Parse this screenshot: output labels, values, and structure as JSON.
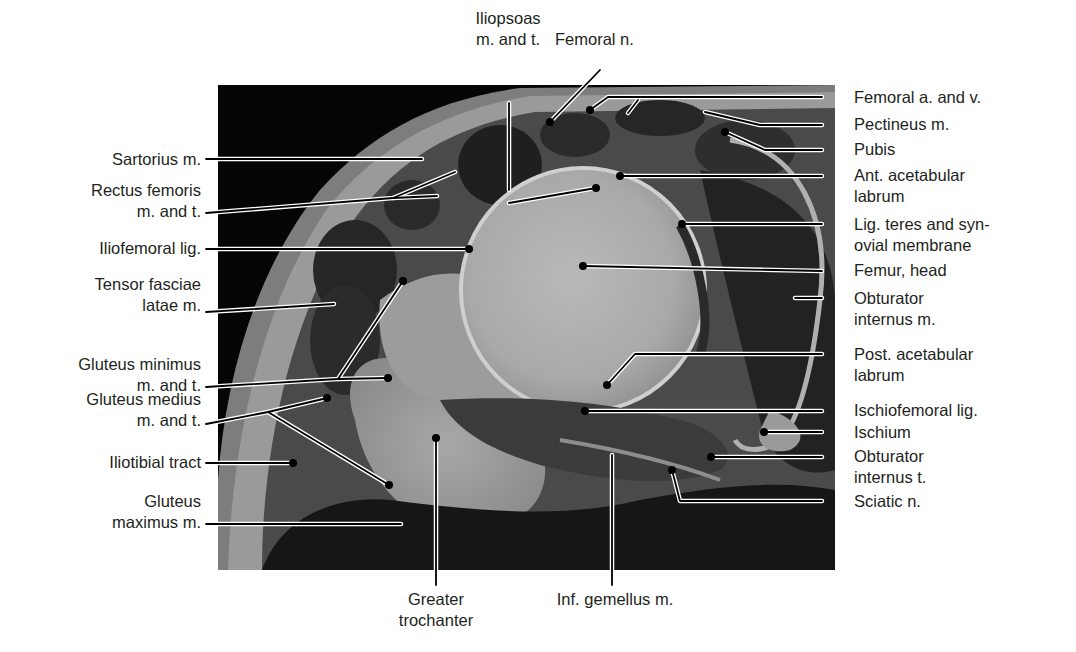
{
  "figure": {
    "type": "anatomical cross-section, hip joint (axial)",
    "colors": {
      "background": "#ffffff",
      "photo_frame": "#000000",
      "label_text": "#231f20",
      "leader_line": "#000000",
      "leader_outline": "#ffffff"
    }
  },
  "labels": {
    "top": [
      {
        "id": "iliopsoas",
        "lines": [
          "Iliopsoas",
          "m. and t."
        ]
      },
      {
        "id": "femoral-n",
        "lines": [
          "Femoral n."
        ]
      }
    ],
    "left": [
      {
        "id": "sartorius",
        "lines": [
          "Sartorius m."
        ]
      },
      {
        "id": "rectus-femoris",
        "lines": [
          "Rectus femoris",
          "m. and t."
        ]
      },
      {
        "id": "iliofemoral-lig",
        "lines": [
          "Iliofemoral lig."
        ]
      },
      {
        "id": "tensor-fasciae-latae",
        "lines": [
          "Tensor fasciae",
          "latae m."
        ]
      },
      {
        "id": "gluteus-minimus",
        "lines": [
          "Gluteus minimus",
          "m. and t."
        ]
      },
      {
        "id": "gluteus-medius",
        "lines": [
          "Gluteus medius",
          "m. and t."
        ]
      },
      {
        "id": "iliotibial-tract",
        "lines": [
          "Iliotibial tract"
        ]
      },
      {
        "id": "gluteus-maximus",
        "lines": [
          "Gluteus",
          "maximus m."
        ]
      }
    ],
    "right": [
      {
        "id": "femoral-a-v",
        "lines": [
          "Femoral a. and v."
        ]
      },
      {
        "id": "pectineus",
        "lines": [
          "Pectineus m."
        ]
      },
      {
        "id": "pubis",
        "lines": [
          "Pubis"
        ]
      },
      {
        "id": "ant-acetabular-labrum",
        "lines": [
          "Ant. acetabular",
          "labrum"
        ]
      },
      {
        "id": "lig-teres",
        "lines": [
          "Lig. teres and syn-",
          "ovial membrane"
        ]
      },
      {
        "id": "femur-head",
        "lines": [
          "Femur, head"
        ]
      },
      {
        "id": "obturator-internus-m",
        "lines": [
          "Obturator",
          "internus m."
        ]
      },
      {
        "id": "post-acetabular-labrum",
        "lines": [
          "Post. acetabular",
          "labrum"
        ]
      },
      {
        "id": "ischiofemoral-lig",
        "lines": [
          "Ischiofemoral lig."
        ]
      },
      {
        "id": "ischium",
        "lines": [
          "Ischium"
        ]
      },
      {
        "id": "obturator-internus-t",
        "lines": [
          "Obturator",
          "internus t."
        ]
      },
      {
        "id": "sciatic-n",
        "lines": [
          "Sciatic n."
        ]
      }
    ],
    "bottom": [
      {
        "id": "greater-trochanter",
        "lines": [
          "Greater",
          "trochanter"
        ]
      },
      {
        "id": "inf-gemellus",
        "lines": [
          "Inf. gemellus m."
        ]
      }
    ]
  }
}
